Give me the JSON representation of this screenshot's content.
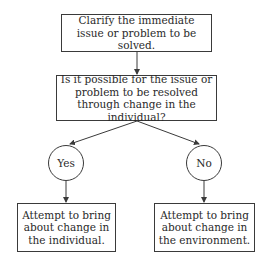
{
  "diagram": {
    "type": "flowchart",
    "nodes": {
      "start": {
        "label": "Clarify the immediate issue or problem to be solved."
      },
      "question": {
        "label": "Is it possible for the issue or problem to be resolved through change in the individual?"
      },
      "yes": {
        "label": "Yes"
      },
      "no": {
        "label": "No"
      },
      "individual": {
        "label": "Attempt to bring about change in the individual."
      },
      "environment": {
        "label": "Attempt to bring about change in the environment."
      }
    },
    "edges": [
      {
        "from": "start",
        "to": "question"
      },
      {
        "from": "question",
        "to": "yes"
      },
      {
        "from": "question",
        "to": "no"
      },
      {
        "from": "yes",
        "to": "individual"
      },
      {
        "from": "no",
        "to": "environment"
      }
    ],
    "colors": {
      "stroke": "#3a3a3a",
      "text": "#2a2a2a",
      "background": "#ffffff"
    }
  }
}
